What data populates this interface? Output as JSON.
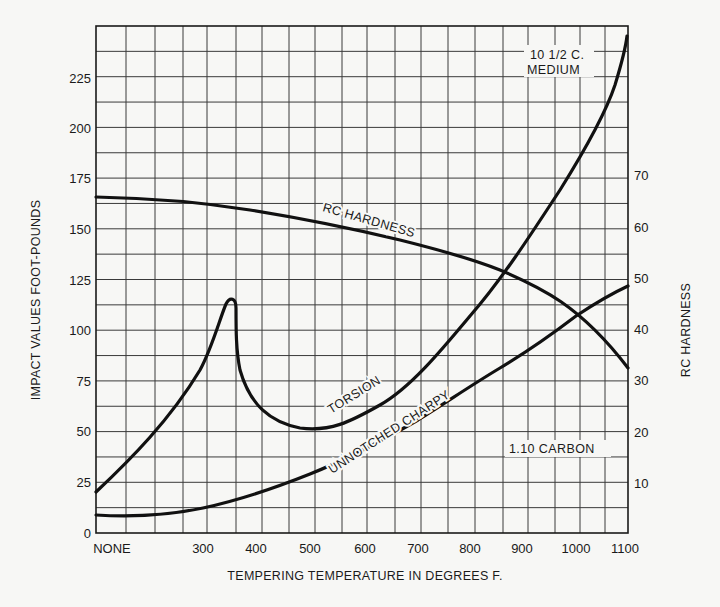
{
  "chart_data": {
    "type": "line",
    "title": "",
    "xlabel": "TEMPERING TEMPERATURE IN DEGREES F.",
    "ylabel": "IMPACT VALUES FOOT-POUNDS",
    "y2label": "RC HARDNESS",
    "x_tick_labels": [
      "NONE",
      "300",
      "400",
      "500",
      "600",
      "700",
      "800",
      "900",
      "1000",
      "1100"
    ],
    "y_tick_labels": [
      "0",
      "25",
      "50",
      "75",
      "100",
      "125",
      "150",
      "175",
      "200",
      "225"
    ],
    "y2_tick_labels": [
      "10",
      "20",
      "30",
      "40",
      "50",
      "60",
      "70"
    ],
    "ylim": [
      0,
      250
    ],
    "y2lim": [
      0,
      74
    ],
    "xlim": [
      "NONE",
      1100
    ],
    "grid": true,
    "legend": "none (curves labeled inline)",
    "annotations": [
      "10 1/2 C. MEDIUM",
      "1.10 CARBON"
    ],
    "series": [
      {
        "name": "TORSION",
        "axis": "left",
        "x": [
          "NONE",
          250,
          300,
          330,
          345,
          355,
          365,
          400,
          450,
          500,
          550,
          600,
          700,
          800,
          900,
          1000,
          1050,
          1100
        ],
        "values": [
          20,
          70,
          95,
          112,
          116,
          112,
          85,
          65,
          55,
          52,
          54,
          60,
          82,
          110,
          142,
          181,
          205,
          245
        ]
      },
      {
        "name": "UNNOTCHED CHARPY",
        "axis": "left",
        "x": [
          "NONE",
          250,
          300,
          400,
          500,
          600,
          700,
          800,
          900,
          1000,
          1100
        ],
        "values": [
          9,
          10,
          12,
          16,
          25,
          36,
          50,
          72,
          95,
          112,
          122
        ]
      },
      {
        "name": "RC HARDNESS",
        "axis": "right",
        "x": [
          "NONE",
          250,
          300,
          400,
          500,
          600,
          700,
          800,
          900,
          1000,
          1100
        ],
        "values": [
          65.5,
          65,
          64,
          63,
          62,
          60.5,
          58,
          54,
          47.5,
          41,
          32.5
        ]
      }
    ]
  },
  "axes": {
    "x_title": "TEMPERING TEMPERATURE IN DEGREES F.",
    "y_title": "IMPACT VALUES FOOT-POUNDS",
    "y2_title": "RC HARDNESS"
  },
  "labels": {
    "rc_hardness": "RC HARDNESS",
    "torsion": "TORSION",
    "unnotched_charpy": "UNNOTCHED CHARPY",
    "medium_line1": "10 1/2 C.",
    "medium_line2": "MEDIUM",
    "carbon": "1.10 CARBON"
  },
  "ticks": {
    "x": [
      {
        "label": "NONE",
        "x": 112
      },
      {
        "label": "300",
        "x": 203
      },
      {
        "label": "400",
        "x": 256
      },
      {
        "label": "500",
        "x": 310
      },
      {
        "label": "600",
        "x": 365
      },
      {
        "label": "700",
        "x": 418
      },
      {
        "label": "800",
        "x": 470
      },
      {
        "label": "900",
        "x": 522
      },
      {
        "label": "1000",
        "x": 576
      },
      {
        "label": "1100",
        "x": 625
      }
    ],
    "y_left": [
      {
        "label": "0",
        "y": 533
      },
      {
        "label": "25",
        "y": 482
      },
      {
        "label": "50",
        "y": 431
      },
      {
        "label": "75",
        "y": 381
      },
      {
        "label": "100",
        "y": 330
      },
      {
        "label": "125",
        "y": 280
      },
      {
        "label": "150",
        "y": 229
      },
      {
        "label": "175",
        "y": 178
      },
      {
        "label": "200",
        "y": 128
      },
      {
        "label": "225",
        "y": 78
      }
    ],
    "y_right": [
      {
        "label": "10",
        "y": 483
      },
      {
        "label": "20",
        "y": 432
      },
      {
        "label": "30",
        "y": 380
      },
      {
        "label": "40",
        "y": 329
      },
      {
        "label": "50",
        "y": 278
      },
      {
        "label": "60",
        "y": 227
      },
      {
        "label": "70",
        "y": 175
      }
    ]
  }
}
